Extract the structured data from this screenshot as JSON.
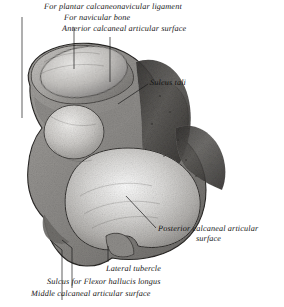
{
  "figure": {
    "background_color": "#ffffff",
    "ink_color": "#1a1a1a",
    "width": 284,
    "height": 307
  },
  "labels": {
    "plantar_ligament": "For plantar calcaneonavicular ligament",
    "navicular_bone": "For navicular bone",
    "anterior_surface": "Anterior calcaneal articular surface",
    "sulcus_tali": "Sulcus tali",
    "posterior_surface_line1": "Posterior calcaneal articular",
    "posterior_surface_line2": "surface",
    "lateral_tubercle": "Lateral tubercle",
    "flexor_sulcus": "Sulcus for Flexor hallucis longus",
    "middle_surface": "Middle calcaneal articular surface"
  }
}
